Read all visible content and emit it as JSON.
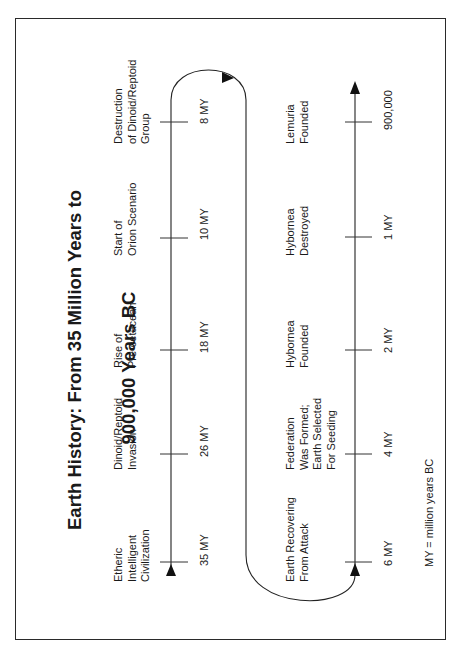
{
  "title": {
    "line1": "Earth History: From 35 Million Years to",
    "line2": "900,000 Years BC"
  },
  "timelines": {
    "upper": {
      "events": [
        {
          "label": "Etheric\nIntelligent\nCivilization",
          "time": "35 MY"
        },
        {
          "label": "Dinoid/Reptoid\nInvasion",
          "time": "26 MY"
        },
        {
          "label": "Rise of\nPre-cetacean",
          "time": "18 MY"
        },
        {
          "label": "Start of\nOrion Scenario",
          "time": "10 MY"
        },
        {
          "label": "Destruction\nof Dinoid/Reptoid\nGroup",
          "time": "8 MY"
        }
      ]
    },
    "lower": {
      "events": [
        {
          "label": "Earth Recovering\nFrom Attack",
          "time": "6 MY"
        },
        {
          "label": "Federation\nWas Formed;\nEarth Selected\nFor Seeding",
          "time": "4 MY"
        },
        {
          "label": "Hybornea\nFounded",
          "time": "2 MY"
        },
        {
          "label": "Hybornea\nDestroyed",
          "time": "1 MY"
        },
        {
          "label": "Lemuria\nFounded",
          "time": "900,000"
        }
      ]
    }
  },
  "footnote": "MY = million years BC",
  "colors": {
    "ink": "#1a1a1a",
    "background": "#ffffff"
  }
}
